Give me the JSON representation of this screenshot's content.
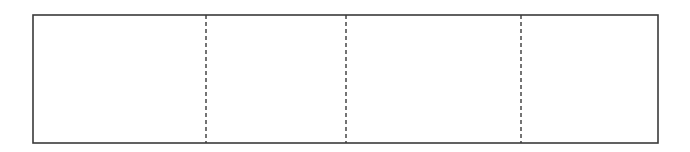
{
  "diagram": {
    "type": "segmented-rectangle",
    "stroke_color": "#3a3a3a",
    "background": "#ffffff",
    "outer_rect": {
      "x1": 33,
      "y1": 15,
      "x2": 658,
      "y2": 143
    },
    "dividers": [
      {
        "x": 206,
        "style": "dashed"
      },
      {
        "x": 346,
        "style": "dashed"
      },
      {
        "x": 521,
        "style": "dashed"
      }
    ],
    "segments": [
      {
        "index": 1,
        "x1": 33,
        "x2": 206
      },
      {
        "index": 2,
        "x1": 206,
        "x2": 346
      },
      {
        "index": 3,
        "x1": 346,
        "x2": 521
      },
      {
        "index": 4,
        "x1": 521,
        "x2": 658
      }
    ]
  }
}
